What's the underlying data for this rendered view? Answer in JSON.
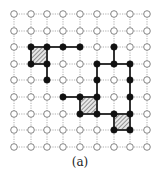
{
  "figure": {
    "caption": "(a)",
    "grid": {
      "cols": 9,
      "rows": 9,
      "x_positions": [
        14,
        31,
        47,
        63,
        80,
        97,
        114,
        130,
        147
      ],
      "y_positions": [
        14,
        31,
        47,
        64,
        80,
        97,
        114,
        130,
        147
      ]
    },
    "colors": {
      "grid_line": "#9a9a9a",
      "open_node_stroke": "#777777",
      "filled_node": "#111111",
      "thick_edge": "#333333",
      "hatch": "#555555"
    },
    "filled_nodes": [
      [
        1,
        2
      ],
      [
        2,
        2
      ],
      [
        3,
        2
      ],
      [
        4,
        2
      ],
      [
        6,
        2
      ],
      [
        1,
        3
      ],
      [
        2,
        3
      ],
      [
        5,
        3
      ],
      [
        6,
        3
      ],
      [
        7,
        3
      ],
      [
        2,
        4
      ],
      [
        5,
        4
      ],
      [
        7,
        4
      ],
      [
        3,
        5
      ],
      [
        4,
        5
      ],
      [
        5,
        5
      ],
      [
        7,
        5
      ],
      [
        4,
        6
      ],
      [
        5,
        6
      ],
      [
        6,
        6
      ],
      [
        7,
        6
      ],
      [
        6,
        7
      ],
      [
        7,
        7
      ]
    ],
    "thick_edges": [
      [
        [
          1,
          2
        ],
        [
          2,
          2
        ]
      ],
      [
        [
          2,
          2
        ],
        [
          3,
          2
        ]
      ],
      [
        [
          3,
          2
        ],
        [
          4,
          2
        ]
      ],
      [
        [
          1,
          2
        ],
        [
          1,
          3
        ]
      ],
      [
        [
          2,
          2
        ],
        [
          2,
          3
        ]
      ],
      [
        [
          1,
          3
        ],
        [
          2,
          3
        ]
      ],
      [
        [
          2,
          3
        ],
        [
          2,
          4
        ]
      ],
      [
        [
          6,
          2
        ],
        [
          6,
          3
        ]
      ],
      [
        [
          5,
          3
        ],
        [
          6,
          3
        ]
      ],
      [
        [
          6,
          3
        ],
        [
          7,
          3
        ]
      ],
      [
        [
          5,
          3
        ],
        [
          5,
          4
        ]
      ],
      [
        [
          5,
          4
        ],
        [
          5,
          5
        ]
      ],
      [
        [
          7,
          3
        ],
        [
          7,
          4
        ]
      ],
      [
        [
          7,
          4
        ],
        [
          7,
          5
        ]
      ],
      [
        [
          7,
          5
        ],
        [
          7,
          6
        ]
      ],
      [
        [
          3,
          5
        ],
        [
          4,
          5
        ]
      ],
      [
        [
          4,
          5
        ],
        [
          5,
          5
        ]
      ],
      [
        [
          4,
          5
        ],
        [
          4,
          6
        ]
      ],
      [
        [
          5,
          5
        ],
        [
          5,
          6
        ]
      ],
      [
        [
          4,
          6
        ],
        [
          5,
          6
        ]
      ],
      [
        [
          5,
          6
        ],
        [
          6,
          6
        ]
      ],
      [
        [
          6,
          6
        ],
        [
          7,
          6
        ]
      ],
      [
        [
          6,
          6
        ],
        [
          6,
          7
        ]
      ],
      [
        [
          7,
          6
        ],
        [
          7,
          7
        ]
      ],
      [
        [
          6,
          7
        ],
        [
          7,
          7
        ]
      ]
    ],
    "hatched_cells": [
      [
        1,
        2
      ],
      [
        4,
        5
      ],
      [
        6,
        6
      ]
    ]
  }
}
